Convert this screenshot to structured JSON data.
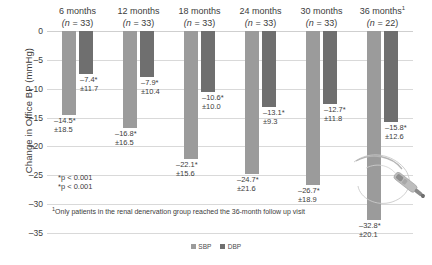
{
  "chart_data": {
    "type": "bar",
    "title": "",
    "xlabel": "",
    "ylabel": "Change in Office BP (mmHg)",
    "ylim": [
      -35,
      0
    ],
    "yticks": [
      "0",
      "-5",
      "-10",
      "-15",
      "-20",
      "-25",
      "-30",
      "-35"
    ],
    "grid": true,
    "legend_position": "bottom",
    "categories": [
      "6 months",
      "12 months",
      "18 months",
      "24 months",
      "30 months",
      "36 months"
    ],
    "category_footnote_marker": "1",
    "category_footnote_applies_to": "36 months",
    "n_labels": [
      "(n = 33)",
      "(n = 33)",
      "(n = 33)",
      "(n = 33)",
      "(n = 33)",
      "(n = 22)"
    ],
    "n_values": [
      33,
      33,
      33,
      33,
      33,
      22
    ],
    "series": [
      {
        "name": "SBP",
        "color": "#9b9b9b",
        "values": [
          -14.5,
          -16.8,
          -22.1,
          -24.7,
          -26.7,
          -32.8
        ],
        "sd": [
          18.5,
          16.5,
          15.6,
          21.6,
          18.9,
          20.1
        ],
        "value_labels": [
          "-14.5*",
          "-16.8*",
          "-22.1*",
          "-24.7*",
          "-26.7*",
          "-32.8*"
        ],
        "sd_labels": [
          "±18.5",
          "±16.5",
          "±15.6",
          "±21.6",
          "±18.9",
          "±20.1"
        ]
      },
      {
        "name": "DBP",
        "color": "#6f6f6f",
        "values": [
          -7.4,
          -7.9,
          -10.6,
          -13.1,
          -12.7,
          -15.8
        ],
        "sd": [
          11.7,
          10.4,
          10.0,
          9.3,
          11.8,
          12.6
        ],
        "value_labels": [
          "-7.4*",
          "-7.9*",
          "-10.6*",
          "-13.1*",
          "-12.7*",
          "-15.8*"
        ],
        "sd_labels": [
          "±11.7",
          "±10.4",
          "±10.0",
          "±9.3",
          "±11.8",
          "±12.6"
        ]
      }
    ],
    "annotations": [
      "*p < 0.001",
      "*p < 0.001"
    ],
    "footnote": "Only patients in the renal denervation group reached the 36-month follow up visit",
    "footnote_marker": "1"
  },
  "legend": {
    "items": [
      {
        "label": "SBP",
        "color": "#9b9b9b"
      },
      {
        "label": "DBP",
        "color": "#6f6f6f"
      }
    ]
  },
  "decoration": {
    "catheter_icon": "renal-denervation-catheter"
  }
}
